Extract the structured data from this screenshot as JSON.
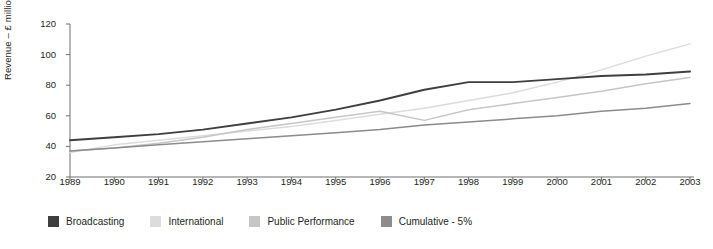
{
  "chart_data": {
    "type": "line",
    "title": "",
    "xlabel": "",
    "ylabel": "Revenue – £ million",
    "x": [
      1989,
      1990,
      1991,
      1992,
      1993,
      1994,
      1995,
      1996,
      1997,
      1998,
      1999,
      2000,
      2001,
      2002,
      2003
    ],
    "categories": [
      "1989",
      "1990",
      "1991",
      "1992",
      "1993",
      "1994",
      "1995",
      "1996",
      "1997",
      "1998",
      "1999",
      "2000",
      "2001",
      "2002",
      "2003"
    ],
    "ylim": [
      20,
      120
    ],
    "yticks": [
      20,
      40,
      60,
      80,
      100,
      120
    ],
    "xlim": [
      1989,
      2003
    ],
    "grid": false,
    "legend_position": "bottom-left",
    "series": [
      {
        "name": "Broadcasting",
        "color": "#3f3f3f",
        "values": [
          44,
          46,
          48,
          51,
          55,
          59,
          64,
          70,
          77,
          82,
          82,
          84,
          86,
          87,
          89
        ]
      },
      {
        "name": "International",
        "color": "#dcdcdc",
        "values": [
          36,
          41,
          44,
          47,
          50,
          53,
          57,
          61,
          65,
          70,
          75,
          82,
          90,
          99,
          107
        ]
      },
      {
        "name": "Public Performance",
        "color": "#c6c6c6",
        "values": [
          37,
          39,
          42,
          46,
          51,
          55,
          59,
          63,
          57,
          64,
          68,
          72,
          76,
          81,
          85
        ]
      },
      {
        "name": "Cumulative - 5%",
        "color": "#8c8c8c",
        "values": [
          37,
          39,
          41,
          43,
          45,
          47,
          49,
          51,
          54,
          56,
          58,
          60,
          63,
          65,
          68
        ]
      }
    ]
  },
  "axis": {
    "y_title": "Revenue – £ million",
    "y_tick_labels": [
      "120",
      "100",
      "80",
      "60",
      "40",
      "20"
    ],
    "x_tick_labels": [
      "1989",
      "1990",
      "1991",
      "1992",
      "1993",
      "1994",
      "1995",
      "1996",
      "1997",
      "1998",
      "1999",
      "2000",
      "2001",
      "2002",
      "2003"
    ],
    "axis_color": "#6e6e6e"
  },
  "legend": {
    "items": [
      {
        "label": "Broadcasting",
        "color": "#3f3f3f"
      },
      {
        "label": "International",
        "color": "#dcdcdc"
      },
      {
        "label": "Public Performance",
        "color": "#c6c6c6"
      },
      {
        "label": "Cumulative - 5%",
        "color": "#8c8c8c"
      }
    ]
  }
}
